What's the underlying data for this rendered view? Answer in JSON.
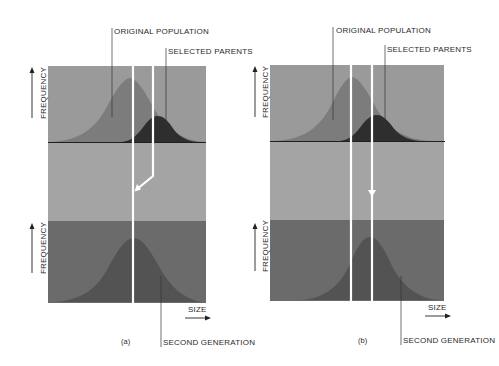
{
  "figure": {
    "panels": [
      {
        "id": "a",
        "caption": "(a)",
        "labels": {
          "original_population": "ORIGINAL POPULATION",
          "selected_parents": "SELECTED PARENTS",
          "second_generation": "SECOND GENERATION",
          "y_axis_top": "FREQUENCY",
          "y_axis_bottom": "FREQUENCY",
          "x_axis": "SIZE"
        },
        "description": "Offspring mean falls back to the original population mean (no heritability)"
      },
      {
        "id": "b",
        "caption": "(b)",
        "labels": {
          "original_population": "ORIGINAL POPULATION",
          "selected_parents": "SELECTED PARENTS",
          "second_generation": "SECOND GENERATION",
          "y_axis_top": "FREQUENCY",
          "y_axis_bottom": "FREQUENCY",
          "x_axis": "SIZE"
        },
        "description": "Offspring mean shifts toward the selected parents mean (full heritability)"
      }
    ],
    "colors": {
      "top_band": "#9a9a9a",
      "middle_band": "#a3a3a3",
      "bottom_band": "#6a6a6a",
      "original_curve": "#7a7a7a",
      "selected_curve": "#2e2e2e",
      "second_gen_curve": "#4f4f4f",
      "guide_lines": "#ffffff",
      "text": "#2a2a2a"
    }
  }
}
